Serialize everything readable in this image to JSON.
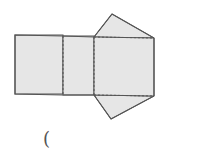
{
  "diagram": {
    "type": "prism-net",
    "colors": {
      "fill": "#e6e6e6",
      "stroke": "#555555"
    }
  },
  "answer_blank": {
    "open_paren": "("
  }
}
